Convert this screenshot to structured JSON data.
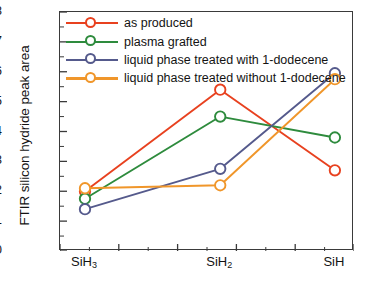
{
  "chart_data": {
    "type": "line",
    "title": "",
    "xlabel": "",
    "ylabel": "FTIR silicon hydride peak area",
    "categories": [
      "SiH3",
      "SiH2",
      "SiH"
    ],
    "category_labels": [
      {
        "base": "SiH",
        "sub": "3"
      },
      {
        "base": "SiH",
        "sub": "2"
      },
      {
        "base": "SiH",
        "sub": ""
      }
    ],
    "ylim": [
      0,
      0.8
    ],
    "yticks": [
      "0",
      "0.1",
      "0.2",
      "0.3",
      "0.4",
      "0.5",
      "0.6",
      "0.7",
      "0.8"
    ],
    "ytick_values": [
      0,
      0.1,
      0.2,
      0.3,
      0.4,
      0.5,
      0.6,
      0.7,
      0.8
    ],
    "grid": false,
    "legend_position": "top-left",
    "marker": "open-circle",
    "series": [
      {
        "name": "as produced",
        "color": "#e8411f",
        "values": [
          0.2,
          0.54,
          0.27
        ]
      },
      {
        "name": "plasma grafted",
        "color": "#2e8b3d",
        "values": [
          0.175,
          0.45,
          0.38
        ]
      },
      {
        "name": "liquid phase treated with 1-dodecene",
        "color": "#555a8c",
        "values": [
          0.14,
          0.275,
          0.595
        ]
      },
      {
        "name": "liquid phase treated without 1-dodecene",
        "color": "#f0962a",
        "values": [
          0.21,
          0.22,
          0.575
        ]
      }
    ]
  },
  "axis": {
    "frame_color": "#3a3a3a",
    "background": "#ffffff"
  }
}
